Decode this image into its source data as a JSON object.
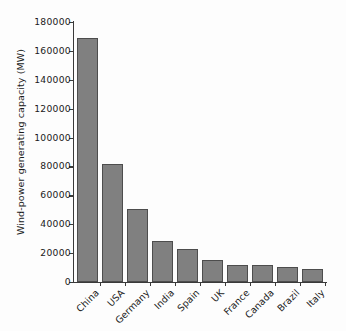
{
  "chart_data": {
    "type": "bar",
    "title": "",
    "xlabel": "",
    "ylabel": "Wind-power generating capacity (MW)",
    "categories": [
      "China",
      "USA",
      "Germany",
      "India",
      "Spain",
      "UK",
      "France",
      "Canada",
      "Brazil",
      "Italy"
    ],
    "values": [
      169000,
      82000,
      50500,
      28700,
      23000,
      15000,
      12100,
      12000,
      10700,
      9300
    ],
    "ylim": [
      0,
      180000
    ],
    "yticks": [
      0,
      20000,
      40000,
      60000,
      80000,
      100000,
      120000,
      140000,
      160000,
      180000
    ],
    "ytick_labels": [
      "0",
      "20000",
      "40000",
      "60000",
      "80000",
      "100000",
      "120000",
      "140000",
      "160000",
      "180000"
    ],
    "grid": false,
    "legend": false,
    "bar_color": "#808080",
    "bar_edge_color": "#4d4d4d",
    "axis_color": "#3a3a3a",
    "background_color": "#fdfdfd"
  }
}
